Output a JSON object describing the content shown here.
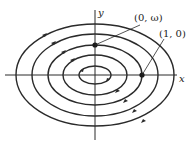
{
  "diagram": {
    "type": "phase-portrait",
    "center": {
      "x": 95,
      "y": 75
    },
    "axes": {
      "x_label": "x",
      "y_label": "y"
    },
    "orbits": [
      {
        "rx": 16,
        "ry": 9
      },
      {
        "rx": 32,
        "ry": 20
      },
      {
        "rx": 47,
        "ry": 30
      },
      {
        "rx": 63,
        "ry": 41
      },
      {
        "rx": 79,
        "ry": 51
      }
    ],
    "flow_direction": "clockwise",
    "points": [
      {
        "label": "(0, ω)",
        "x": 95,
        "y": 45
      },
      {
        "label": "(1, 0)",
        "x": 142,
        "y": 75
      }
    ],
    "colors": {
      "stroke": "#2a2a2a",
      "background": "#ffffff"
    }
  }
}
